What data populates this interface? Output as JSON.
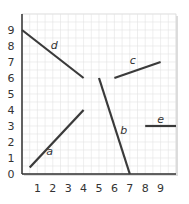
{
  "chart_data": {
    "type": "line",
    "title": "",
    "xlabel": "",
    "ylabel": "",
    "x_ticks": [
      "1",
      "2",
      "3",
      "4",
      "5",
      "6",
      "7",
      "8",
      "9"
    ],
    "y_ticks": [
      "0",
      "1",
      "2",
      "3",
      "4",
      "5",
      "6",
      "7",
      "8",
      "9"
    ],
    "xlim": [
      0,
      10
    ],
    "ylim": [
      0,
      10
    ],
    "grid": true,
    "legend": "none",
    "series": [
      {
        "name": "a",
        "points": [
          [
            0.5,
            0.4
          ],
          [
            4,
            4
          ]
        ]
      },
      {
        "name": "b",
        "points": [
          [
            5,
            6
          ],
          [
            7,
            0
          ]
        ]
      },
      {
        "name": "c",
        "points": [
          [
            6,
            6
          ],
          [
            9,
            7
          ]
        ]
      },
      {
        "name": "d",
        "points": [
          [
            0,
            9
          ],
          [
            4,
            6
          ]
        ]
      },
      {
        "name": "e",
        "points": [
          [
            8,
            3
          ],
          [
            10,
            3
          ]
        ]
      }
    ],
    "labels": [
      {
        "text": "a",
        "x": 1.8,
        "y": 1.2
      },
      {
        "text": "b",
        "x": 6.6,
        "y": 2.5
      },
      {
        "text": "c",
        "x": 7.2,
        "y": 6.9
      },
      {
        "text": "d",
        "x": 2.1,
        "y": 7.8
      },
      {
        "text": "e",
        "x": 9.0,
        "y": 3.2
      }
    ],
    "colors": {
      "line": "#3a3a3a",
      "grid": "#e2e2e2",
      "axis": "#333333"
    }
  }
}
